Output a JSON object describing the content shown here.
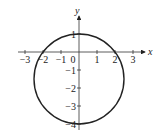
{
  "chart_data": {
    "type": "line",
    "title": "",
    "xlabel": "x",
    "ylabel": "y",
    "xlim": [
      -3.3,
      3.6
    ],
    "ylim": [
      -4.2,
      2.2
    ],
    "grid": false,
    "x_ticks": [
      -3,
      -2,
      -1,
      0,
      1,
      2,
      3
    ],
    "x_tick_labels": [
      "−3",
      "−2",
      "−1",
      "0",
      "1",
      "2",
      "3"
    ],
    "y_ticks": [
      1,
      -1,
      -2,
      -3,
      -4
    ],
    "y_tick_labels": [
      "1",
      "−1",
      "−2",
      "−3",
      "−4"
    ],
    "series": [
      {
        "name": "circle",
        "shape": "circle",
        "center": [
          0,
          -1.5
        ],
        "radius": 2.5,
        "x_intercepts": [
          -2,
          2
        ],
        "y_intercepts": [
          1,
          -4
        ]
      }
    ]
  }
}
